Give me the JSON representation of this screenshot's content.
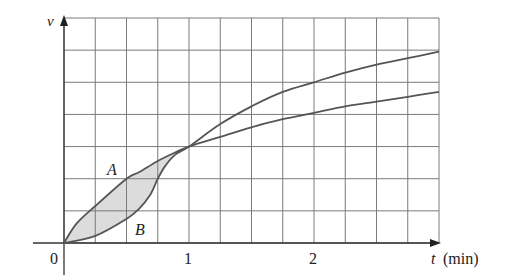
{
  "chart_data": {
    "type": "line",
    "title": "",
    "xlabel_var": "t",
    "xlabel_unit": "(min)",
    "ylabel": "v",
    "origin_label": "0",
    "x_ticks": [
      {
        "value": 1,
        "label": "1"
      },
      {
        "value": 2,
        "label": "2"
      }
    ],
    "xlim": [
      0,
      3
    ],
    "ylim": [
      0,
      7
    ],
    "grid": true,
    "grid_x_step": 0.25,
    "grid_y_step": 1,
    "legend": "none",
    "shaded_region": {
      "between": [
        "A",
        "B"
      ],
      "from_t": 0,
      "to_t": 1,
      "color": "#dcdcdc"
    },
    "series": [
      {
        "name": "A",
        "label": "A",
        "label_pos": {
          "t": 0.4,
          "v": 2.3
        },
        "color": "#555555",
        "x": [
          0,
          0.1,
          0.25,
          0.5,
          0.6,
          0.75,
          0.88,
          1,
          1.25,
          1.5,
          1.75,
          2,
          2.25,
          2.5,
          2.75,
          3
        ],
        "values": [
          0,
          0.6,
          1.15,
          2.0,
          2.2,
          2.55,
          2.8,
          3.0,
          3.3,
          3.6,
          3.85,
          4.05,
          4.25,
          4.4,
          4.55,
          4.7
        ]
      },
      {
        "name": "B",
        "label": "B",
        "label_pos": {
          "t": 0.62,
          "v": 0.45
        },
        "color": "#555555",
        "x": [
          0,
          0.25,
          0.5,
          0.6,
          0.69,
          0.75,
          0.81,
          0.89,
          1,
          1.25,
          1.5,
          1.75,
          2,
          2.25,
          2.5,
          2.75,
          3
        ],
        "values": [
          0,
          0.22,
          0.75,
          1.06,
          1.5,
          2.0,
          2.4,
          2.75,
          3.0,
          3.7,
          4.25,
          4.7,
          5.0,
          5.3,
          5.55,
          5.75,
          5.95
        ]
      }
    ]
  }
}
